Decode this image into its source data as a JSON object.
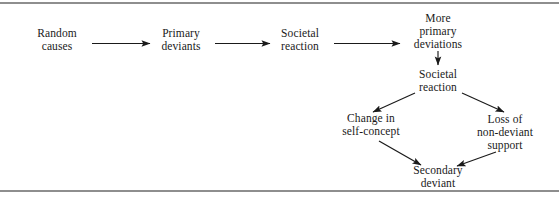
{
  "figure": {
    "type": "flow-diagram",
    "background_color": "#ffffff",
    "text_color": "#1a1a1a",
    "rule_color": "#8e8e8e",
    "arrow_color": "#1a1a1a"
  },
  "nodes": [
    {
      "id": "random-causes",
      "lines": [
        "Random",
        "causes"
      ],
      "line1": "Random",
      "line2": "causes",
      "x": 57,
      "y": 40
    },
    {
      "id": "primary-deviants",
      "lines": [
        "Primary",
        "deviants"
      ],
      "line1": "Primary",
      "line2": "deviants",
      "x": 181,
      "y": 40
    },
    {
      "id": "societal-reaction-1",
      "lines": [
        "Societal",
        "reaction"
      ],
      "line1": "Societal",
      "line2": "reaction",
      "x": 300,
      "y": 40
    },
    {
      "id": "more-primary-deviations",
      "lines": [
        "More",
        "primary",
        "deviations"
      ],
      "line1": "More",
      "line2": "primary",
      "line3": "deviations",
      "x": 438,
      "y": 31
    },
    {
      "id": "societal-reaction-2",
      "lines": [
        "Societal",
        "reaction"
      ],
      "line1": "Societal",
      "line2": "reaction",
      "x": 438,
      "y": 81
    },
    {
      "id": "change-in-self-concept",
      "lines": [
        "Change in",
        "self-concept"
      ],
      "line1": "Change in",
      "line2": "self-concept",
      "x": 371,
      "y": 125
    },
    {
      "id": "loss-of-non-deviant-support",
      "lines": [
        "Loss of",
        "non-deviant",
        "support"
      ],
      "line1": "Loss of",
      "line2": "non-deviant",
      "line3": "support",
      "x": 505,
      "y": 132
    },
    {
      "id": "secondary-deviant",
      "lines": [
        "Secondary",
        "deviant"
      ],
      "line1": "Secondary",
      "line2": "deviant",
      "x": 438,
      "y": 177
    }
  ],
  "edges": [
    {
      "id": "random-to-primary",
      "from": "random-causes",
      "to": "primary-deviants",
      "direction": "right"
    },
    {
      "id": "primary-to-reaction",
      "from": "primary-deviants",
      "to": "societal-reaction-1",
      "direction": "right"
    },
    {
      "id": "reaction-to-more",
      "from": "societal-reaction-1",
      "to": "more-primary-deviations",
      "direction": "right"
    },
    {
      "id": "more-to-reaction2",
      "from": "more-primary-deviations",
      "to": "societal-reaction-2",
      "direction": "down"
    },
    {
      "id": "reaction2-to-change",
      "from": "societal-reaction-2",
      "to": "change-in-self-concept",
      "direction": "down-left"
    },
    {
      "id": "reaction2-to-loss",
      "from": "societal-reaction-2",
      "to": "loss-of-non-deviant-support",
      "direction": "down-right"
    },
    {
      "id": "change-to-secondary",
      "from": "change-in-self-concept",
      "to": "secondary-deviant",
      "direction": "down-right"
    },
    {
      "id": "loss-to-secondary",
      "from": "loss-of-non-deviant-support",
      "to": "secondary-deviant",
      "direction": "down-left"
    }
  ]
}
